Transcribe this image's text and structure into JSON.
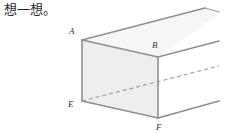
{
  "page": {
    "background_color": "#ffffff",
    "width": 225,
    "height": 133
  },
  "prompt": {
    "text": "想一想。"
  },
  "figure": {
    "caption": "open rectangular prism in oblique perspective",
    "fill_color": "#eeeeec",
    "stroke_color": "#8a8a8a",
    "hidden_stroke_color": "#9a9a9a",
    "labels": {
      "a": "A",
      "b": "B",
      "e": "E",
      "f": "F"
    },
    "vertices": {
      "A": [
        82,
        40
      ],
      "B": [
        158,
        57
      ],
      "E": [
        82,
        101
      ],
      "F": [
        158,
        118
      ],
      "A_far": [
        205,
        8
      ],
      "B_far": [
        219,
        43
      ],
      "F_far": [
        216,
        101
      ],
      "top_back": [
        168,
        24
      ]
    }
  }
}
